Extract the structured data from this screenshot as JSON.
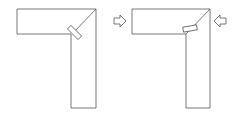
{
  "diagram": {
    "stroke_color": "#555555",
    "background": "#ffffff",
    "figures": [
      {
        "name": "unclamped-joint",
        "has_biscuit": true,
        "biscuit_orientation": "diagonal"
      },
      {
        "name": "clamped-joint",
        "has_biscuit": true,
        "biscuit_orientation": "horizontal"
      }
    ],
    "arrows": [
      {
        "name": "arrow-right",
        "direction": "right"
      },
      {
        "name": "arrow-left",
        "direction": "left"
      }
    ]
  }
}
